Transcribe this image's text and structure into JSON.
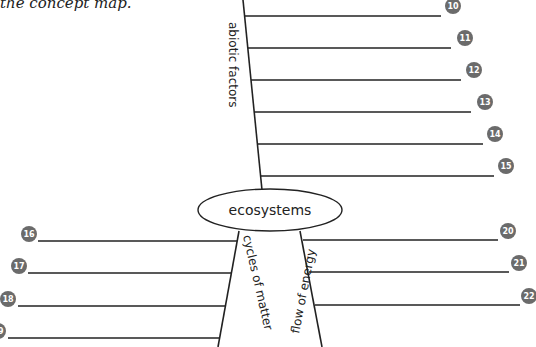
{
  "caption": "the concept map.",
  "center": {
    "label": "ecosystems"
  },
  "branches": {
    "abiotic": {
      "label": "abiotic factors",
      "blanks": [
        {
          "number": "10",
          "value": ""
        },
        {
          "number": "11",
          "value": ""
        },
        {
          "number": "12",
          "value": ""
        },
        {
          "number": "13",
          "value": ""
        },
        {
          "number": "14",
          "value": ""
        },
        {
          "number": "15",
          "value": ""
        }
      ]
    },
    "cycles": {
      "label": "cycles of matter",
      "blanks": [
        {
          "number": "16",
          "value": ""
        },
        {
          "number": "17",
          "value": ""
        },
        {
          "number": "18",
          "value": ""
        },
        {
          "number": "19",
          "value": ""
        }
      ]
    },
    "energy": {
      "label": "flow of energy",
      "blanks": [
        {
          "number": "20",
          "value": ""
        },
        {
          "number": "21",
          "value": ""
        },
        {
          "number": "22",
          "value": ""
        }
      ]
    }
  },
  "colors": {
    "line": "#222222",
    "badge": "#6b6b6b",
    "badge_text": "#ffffff"
  }
}
